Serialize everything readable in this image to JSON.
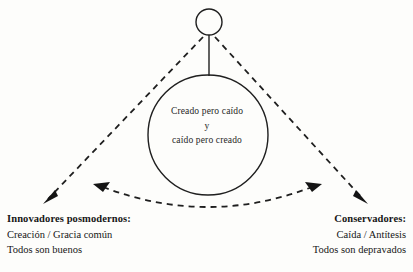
{
  "diagram": {
    "colors": {
      "background": "#fdfdfb",
      "stroke": "#1f1f1f",
      "text": "#161616"
    },
    "center_node": {
      "line1": "Creado pero caído",
      "line2": "y",
      "line3": "caído pero creado"
    },
    "top_node": {
      "label": "small-circle-node"
    },
    "left_corner": {
      "heading": "Innovadores posmodernos:",
      "line1": "Creación / Gracia común",
      "line2": "Todos son buenos"
    },
    "right_corner": {
      "heading": "Conservadores:",
      "line1": "Caída / Antítesis",
      "line2": "Todos son depravados"
    },
    "connectors": [
      {
        "name": "dashed-diagonal-left",
        "from": "top-node",
        "to": "left-corner",
        "style": "dashed",
        "arrow": "end"
      },
      {
        "name": "dashed-diagonal-right",
        "from": "top-node",
        "to": "right-corner",
        "style": "dashed",
        "arrow": "end"
      },
      {
        "name": "dashed-arc-bottom",
        "from": "right-corner",
        "to": "left-corner",
        "style": "dashed",
        "arrow": "both"
      },
      {
        "name": "stem-line",
        "from": "top-node",
        "to": "center-circle",
        "style": "solid",
        "arrow": "none"
      }
    ]
  }
}
